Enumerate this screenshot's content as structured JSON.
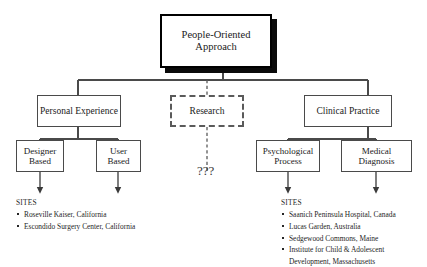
{
  "diagram": {
    "root": {
      "label": "People-Oriented Approach"
    },
    "tier2": [
      {
        "label": "Personal Experience",
        "style": "solid"
      },
      {
        "label": "Research",
        "style": "dashed"
      },
      {
        "label": "Clinical Practice",
        "style": "solid"
      }
    ],
    "tier3": [
      {
        "label": "Designer Based"
      },
      {
        "label": "User Based"
      },
      {
        "label": "Psychological Process"
      },
      {
        "label": "Medical Diagnosis"
      }
    ],
    "unknown_marker": "???",
    "sites_left": {
      "title": "SITES",
      "items": [
        "Roseville Kaiser, California",
        "Escondido Surgery Center, California"
      ]
    },
    "sites_right": {
      "title": "SITES",
      "items": [
        "Saanich Peninsula Hospital, Canada",
        "Lucas Garden, Australia",
        "Sedgewood Commons, Maine",
        "Institute for Child & Adolescent Development, Massachusetts"
      ]
    },
    "colors": {
      "line": "#4a4a4a",
      "root_border": "#000000",
      "shadow": "#0a0a0a",
      "dashed_border": "#5a5a5a",
      "text": "#1a1a1a",
      "background": "#ffffff"
    }
  }
}
